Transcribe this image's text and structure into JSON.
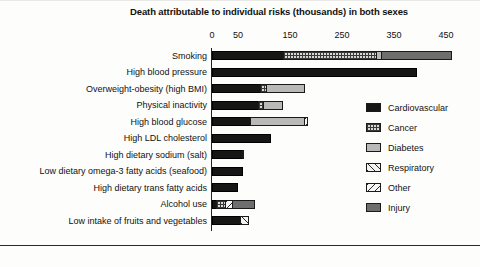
{
  "chart_data": {
    "type": "bar",
    "orientation": "horizontal",
    "stacked": true,
    "title": "Death attributable to individual risks (thousands) in both sexes",
    "xlabel": "",
    "ylabel": "",
    "xlim": [
      0,
      480
    ],
    "grid": false,
    "legend_position": "right",
    "tick_labels": [
      "0",
      "50",
      "150",
      "250",
      "350",
      "450"
    ],
    "tick_values": [
      0,
      50,
      150,
      250,
      350,
      450
    ],
    "legend": [
      {
        "name": "Cardiovascular",
        "pattern": "solid-black",
        "color": "#161616"
      },
      {
        "name": "Cancer",
        "pattern": "checkered-dots",
        "color": "#d8d8d8"
      },
      {
        "name": "Diabetes",
        "pattern": "solid-light-gray",
        "color": "#b9b9b9"
      },
      {
        "name": "Respiratory",
        "pattern": "diagonal-hatch-up",
        "color": "#f2f2f2"
      },
      {
        "name": "Other",
        "pattern": "diagonal-hatch-down",
        "color": "#f6f6f6"
      },
      {
        "name": "Injury",
        "pattern": "solid-dark-gray",
        "color": "#6e6e6e"
      }
    ],
    "categories": [
      "Smoking",
      "High blood pressure",
      "Overweight-obesity (high BMI)",
      "Physical inactivity",
      "High blood glucose",
      "High LDL cholesterol",
      "High dietary sodium (salt)",
      "Low dietary omega-3 fatty acids (seafood)",
      "High dietary trans fatty acids",
      "Alcohol use",
      "Low intake of fruits and vegetables"
    ],
    "series": [
      {
        "name": "Cardiovascular",
        "values": [
          138,
          395,
          95,
          90,
          75,
          113,
          60,
          60,
          50,
          10,
          55
        ]
      },
      {
        "name": "Cancer",
        "values": [
          182,
          0,
          12,
          12,
          0,
          0,
          4,
          0,
          0,
          18,
          0
        ]
      },
      {
        "name": "Diabetes",
        "values": [
          10,
          0,
          75,
          38,
          105,
          0,
          0,
          0,
          0,
          0,
          0
        ]
      },
      {
        "name": "Respiratory",
        "values": [
          0,
          0,
          0,
          0,
          0,
          0,
          0,
          0,
          0,
          0,
          18
        ]
      },
      {
        "name": "Other",
        "values": [
          0,
          0,
          0,
          0,
          8,
          0,
          0,
          0,
          0,
          16,
          0
        ]
      },
      {
        "name": "Injury",
        "values": [
          137,
          0,
          0,
          0,
          0,
          0,
          0,
          0,
          0,
          44,
          0
        ]
      }
    ],
    "totals": [
      467,
      395,
      182,
      140,
      188,
      113,
      64,
      60,
      50,
      88,
      73
    ]
  }
}
